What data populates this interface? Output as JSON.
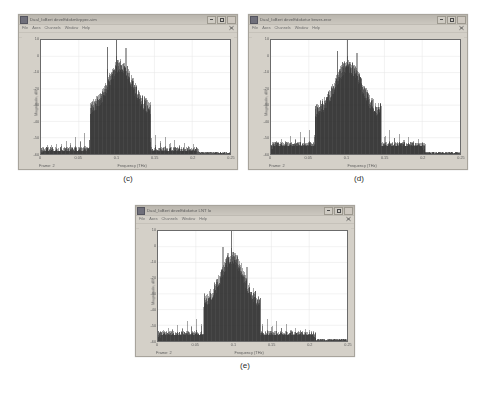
{
  "figure": {
    "background": "#ffffff",
    "panels": [
      {
        "caption": "(c)",
        "window": {
          "title": "Dual_IoBert  deveEdokmkrpper-sim",
          "icon": "app-icon",
          "buttons": {
            "minimize": "minimize-icon",
            "maximize": "maximize-icon",
            "close": "close-icon"
          },
          "menus": [
            "File",
            "Axes",
            "Channels",
            "Window",
            "Help"
          ],
          "status_frame": "Frame: 2"
        }
      },
      {
        "caption": "(d)",
        "window": {
          "title": "Dual_IoBert  deveEdoketur brwer-eror",
          "icon": "app-icon",
          "buttons": {
            "minimize": "minimize-icon",
            "maximize": "maximize-icon",
            "close": "close-icon"
          },
          "menus": [
            "File",
            "Axes",
            "Channels",
            "Window",
            "Help"
          ],
          "status_frame": "Frame: 2"
        }
      },
      {
        "caption": "(e)",
        "window": {
          "title": "Dual_IoBert  deveEdoketur LNT lo",
          "icon": "app-icon",
          "buttons": {
            "minimize": "minimize-icon",
            "maximize": "maximize-icon",
            "close": "close-icon"
          },
          "menus": [
            "File",
            "Axes",
            "Channels",
            "Window",
            "Help"
          ],
          "status_frame": "Frame: 2"
        }
      }
    ]
  },
  "chart_data": [
    {
      "type": "line",
      "title": "(c)",
      "xlabel": "Frequency (THz)",
      "ylabel": "Magnitude, dB",
      "xlim": [
        0,
        0.25
      ],
      "ylim": [
        -60,
        10
      ],
      "xticks": [
        0,
        0.05,
        0.1,
        0.15,
        0.2,
        0.25
      ],
      "xtick_labels": [
        "0",
        "0.05",
        "0.1",
        "0.15",
        "0.2",
        "0.25"
      ],
      "yticks": [
        10,
        0,
        -10,
        -20,
        -30,
        -40,
        -50,
        -60
      ],
      "ytick_labels": [
        "10",
        "0",
        "-10",
        "-20",
        "-30",
        "-40",
        "-50",
        "-60"
      ],
      "grid": true,
      "legend": "none",
      "series": [
        {
          "name": "Magnitude spectrum",
          "color": "#333333",
          "noise_floor": -58,
          "comb_teeth": {
            "spacing": 0.00625,
            "sideband_peak": -43,
            "region": [
              0.005,
              0.205
            ]
          },
          "main_lobe": {
            "center": 0.105,
            "half_width": 0.032,
            "peak": -1,
            "shoulder": -28
          },
          "tall_spikes": [
            {
              "x": 0.0875,
              "y": -8
            },
            {
              "x": 0.1,
              "y": 0
            },
            {
              "x": 0.1125,
              "y": -9
            }
          ]
        }
      ]
    },
    {
      "type": "line",
      "title": "(d)",
      "xlabel": "Frequency (THz)",
      "ylabel": "Magnitude, dB",
      "xlim": [
        0,
        0.25
      ],
      "ylim": [
        -60,
        10
      ],
      "xticks": [
        0,
        0.05,
        0.1,
        0.15,
        0.2,
        0.25
      ],
      "xtick_labels": [
        "0",
        "0.05",
        "0.1",
        "0.15",
        "0.2",
        "0.25"
      ],
      "yticks": [
        10,
        0,
        -10,
        -20,
        -30,
        -40,
        -50,
        -60
      ],
      "ytick_labels": [
        "10",
        "0",
        "-10",
        "-20",
        "-30",
        "-40",
        "-50",
        "-60"
      ],
      "grid": true,
      "legend": "none",
      "series": [
        {
          "name": "Magnitude spectrum",
          "color": "#333333",
          "noise_floor": -55,
          "comb_teeth": {
            "spacing": 0.00625,
            "sideband_peak": -40,
            "region": [
              0.004,
              0.2
            ]
          },
          "main_lobe": {
            "center": 0.102,
            "half_width": 0.035,
            "peak": -1,
            "shoulder": -30
          },
          "tall_spikes": [
            {
              "x": 0.088,
              "y": -11
            },
            {
              "x": 0.101,
              "y": 0
            },
            {
              "x": 0.114,
              "y": -12
            }
          ]
        }
      ]
    },
    {
      "type": "line",
      "title": "(e)",
      "xlabel": "Frequency (THz)",
      "ylabel": "Magnitude, dB",
      "xlim": [
        0,
        0.25
      ],
      "ylim": [
        -60,
        10
      ],
      "xticks": [
        0,
        0.05,
        0.1,
        0.15,
        0.2,
        0.25
      ],
      "xtick_labels": [
        "0",
        "0.05",
        "0.1",
        "0.15",
        "0.2",
        "0.25"
      ],
      "yticks": [
        10,
        0,
        -10,
        -20,
        -30,
        -40,
        -50,
        -60
      ],
      "ytick_labels": [
        "10",
        "0",
        "-10",
        "-20",
        "-30",
        "-40",
        "-50",
        "-60"
      ],
      "grid": true,
      "legend": "none",
      "series": [
        {
          "name": "Magnitude spectrum",
          "color": "#333333",
          "noise_floor": -56,
          "comb_teeth": {
            "spacing": 0.00625,
            "sideband_peak": -42,
            "region": [
              0.004,
              0.205
            ]
          },
          "main_lobe": {
            "center": 0.098,
            "half_width": 0.03,
            "peak": -2,
            "shoulder": -31
          },
          "tall_spikes": [
            {
              "x": 0.086,
              "y": -14
            },
            {
              "x": 0.097,
              "y": -1
            },
            {
              "x": 0.118,
              "y": -27
            }
          ]
        }
      ]
    }
  ]
}
